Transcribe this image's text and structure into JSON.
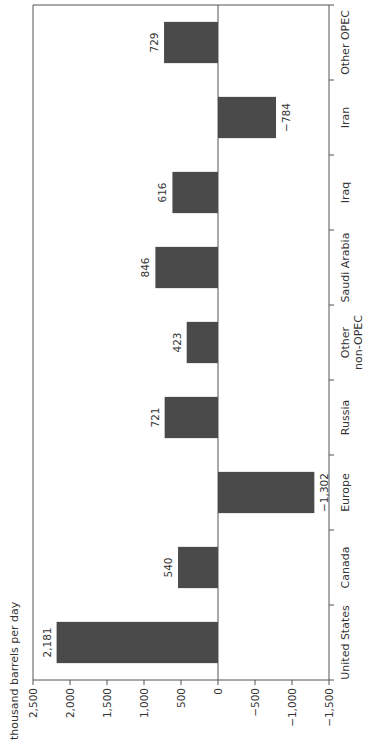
{
  "chart_data": {
    "type": "bar",
    "title": "",
    "ylabel": "thousand barrels per day",
    "xlabel": "",
    "categories": [
      "United States",
      "Canada",
      "Europe",
      "Russia",
      "Other non-OPEC",
      "Saudi Arabia",
      "Iraq",
      "Iran",
      "Other OPEC"
    ],
    "category_lines": [
      [
        "United States"
      ],
      [
        "Canada"
      ],
      [
        "Europe"
      ],
      [
        "Russia"
      ],
      [
        "Other",
        "non-OPEC"
      ],
      [
        "Saudi Arabia"
      ],
      [
        "Iraq"
      ],
      [
        "Iran"
      ],
      [
        "Other OPEC"
      ]
    ],
    "values": [
      2181,
      540,
      -1302,
      721,
      423,
      846,
      616,
      -784,
      729
    ],
    "value_labels": [
      "2,181",
      "540",
      "−1,302",
      "721",
      "423",
      "846",
      "616",
      "−784",
      "729"
    ],
    "ylim": [
      -1500,
      2500
    ],
    "yticks": [
      2500,
      2000,
      1500,
      1000,
      500,
      0,
      -500,
      -1000,
      -1500
    ],
    "ytick_labels": [
      "2,500",
      "2,000",
      "1,500",
      "1,000",
      "500",
      "0",
      "−500",
      "−1,000",
      "−1,500"
    ],
    "grid": false,
    "legend": null,
    "orientation_note": "figure rotated 90 degrees counterclockwise",
    "bar_color": "#4a4a4a"
  }
}
